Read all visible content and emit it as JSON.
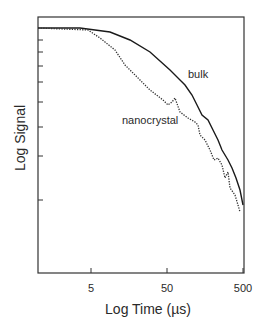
{
  "chart_data": {
    "type": "line",
    "title": "",
    "xlabel": "Log Time (µs)",
    "ylabel": "Log Signal",
    "xscale": "log",
    "yscale": "log",
    "xlim": [
      1,
      500
    ],
    "x_ticks": [
      5,
      50,
      500
    ],
    "x_tick_labels": [
      "5",
      "50",
      "500"
    ],
    "y_tick_labels": [],
    "grid": false,
    "legend": "inline annotations",
    "annotations": [
      {
        "text": "bulk",
        "near_x": 90
      },
      {
        "text": "nanocrystal",
        "near_x": 30
      }
    ],
    "series": [
      {
        "name": "bulk",
        "style": "solid",
        "points_px": [
          [
            38,
            28
          ],
          [
            80,
            28
          ],
          [
            110,
            32
          ],
          [
            130,
            40
          ],
          [
            150,
            52
          ],
          [
            170,
            70
          ],
          [
            180,
            80
          ],
          [
            185,
            85
          ],
          [
            192,
            95
          ],
          [
            197,
            105
          ],
          [
            202,
            115
          ],
          [
            208,
            120
          ],
          [
            213,
            130
          ],
          [
            218,
            140
          ],
          [
            222,
            150
          ],
          [
            228,
            160
          ],
          [
            232,
            168
          ],
          [
            236,
            178
          ],
          [
            240,
            190
          ],
          [
            243,
            205
          ]
        ]
      },
      {
        "name": "nanocrystal",
        "style": "dotted",
        "points_px": [
          [
            38,
            28
          ],
          [
            88,
            30
          ],
          [
            100,
            38
          ],
          [
            115,
            50
          ],
          [
            125,
            65
          ],
          [
            135,
            75
          ],
          [
            140,
            80
          ],
          [
            150,
            90
          ],
          [
            163,
            100
          ],
          [
            168,
            105
          ],
          [
            172,
            102
          ],
          [
            175,
            98
          ],
          [
            180,
            112
          ],
          [
            188,
            118
          ],
          [
            195,
            122
          ],
          [
            198,
            125
          ],
          [
            200,
            135
          ],
          [
            205,
            140
          ],
          [
            210,
            150
          ],
          [
            214,
            160
          ],
          [
            218,
            158
          ],
          [
            222,
            165
          ],
          [
            225,
            178
          ],
          [
            228,
            172
          ],
          [
            230,
            188
          ],
          [
            235,
            195
          ],
          [
            238,
            205
          ],
          [
            240,
            212
          ]
        ]
      }
    ]
  },
  "labels": {
    "ylabel": "Log Signal",
    "xlabel": "Log Time (µs)",
    "xtick_5": "5",
    "xtick_50": "50",
    "xtick_500": "500",
    "bulk": "bulk",
    "nanocrystal": "nanocrystal"
  }
}
